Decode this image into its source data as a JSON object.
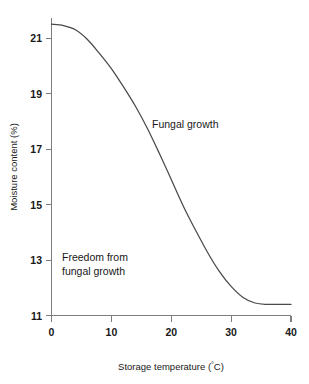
{
  "chart_data": {
    "type": "line",
    "title": "",
    "xlabel": "Storage temperature (°C)",
    "ylabel": "Moisture content (%)",
    "xlim": [
      0,
      40
    ],
    "ylim": [
      11,
      22
    ],
    "grid": false,
    "legend": false,
    "x_ticks": [
      "0",
      "10",
      "20",
      "30",
      "40"
    ],
    "x_tick_values": [
      0,
      10,
      20,
      30,
      40
    ],
    "y_ticks": [
      "11",
      "13",
      "15",
      "17",
      "19",
      "21"
    ],
    "y_tick_values": [
      11,
      13,
      15,
      17,
      19,
      21
    ],
    "series": [
      {
        "name": "Safe moisture content limit",
        "x": [
          0,
          2,
          4,
          6,
          8,
          10,
          12,
          14,
          16,
          18,
          20,
          22,
          24,
          26,
          28,
          30,
          32,
          34,
          36,
          38,
          40
        ],
        "values": [
          21.5,
          21.45,
          21.3,
          20.95,
          20.45,
          19.9,
          19.25,
          18.55,
          17.75,
          16.85,
          15.9,
          14.95,
          14.1,
          13.3,
          12.6,
          12.05,
          11.65,
          11.45,
          11.4,
          11.4,
          11.4
        ]
      }
    ],
    "annotations": [
      {
        "text": "Fungal growth",
        "x": 21.5,
        "y": 18.0,
        "region": "above-curve"
      },
      {
        "text": "Freedom from",
        "x": 6.0,
        "y": 13.6,
        "region": "below-curve"
      },
      {
        "text": "fungal growth",
        "x": 6.0,
        "y": 13.1,
        "region": "below-curve"
      }
    ]
  },
  "figure": {
    "axis_color": "#7d7d7d",
    "curve_color": "#4a4a4a",
    "text_color": "#181818",
    "background_color": "#ffffff"
  },
  "labels": {
    "x_axis_title_prefix": "Storage temperature (",
    "x_axis_title_degree": "°",
    "x_axis_title_suffix": "C)",
    "y_axis_title": "Moisture content (%)",
    "annotation_upper": "Fungal growth",
    "annotation_lower_line1": "Freedom from",
    "annotation_lower_line2": "fungal growth",
    "y_tick_21": "21",
    "y_tick_19": "19",
    "y_tick_17": "17",
    "y_tick_15": "15",
    "y_tick_13": "13",
    "y_tick_11": "11",
    "x_tick_0": "0",
    "x_tick_10": "10",
    "x_tick_20": "20",
    "x_tick_30": "30",
    "x_tick_40": "40"
  }
}
